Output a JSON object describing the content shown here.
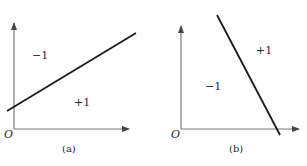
{
  "panels": [
    {
      "caption": "(a)",
      "origin_label": "O",
      "region_above": "−1",
      "region_below": "+1",
      "line": {
        "x1": 7,
        "y1": 111,
        "x2": 136,
        "y2": 33,
        "slope": "positive"
      }
    },
    {
      "caption": "(b)",
      "origin_label": "O",
      "region_left": "−1",
      "region_right": "+1",
      "line": {
        "x1": 217,
        "y1": 15,
        "x2": 280,
        "y2": 135,
        "slope": "negative"
      }
    }
  ],
  "colors": {
    "axis": "#7a7a7a",
    "line": "#1a1a1a",
    "text": "#2a2a2a",
    "background": "#ffffff"
  }
}
